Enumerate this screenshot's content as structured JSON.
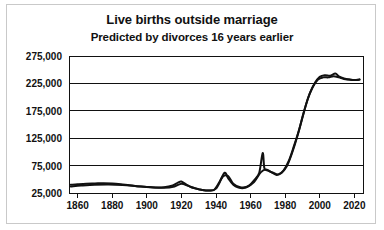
{
  "chart_data": {
    "type": "line",
    "title": "Live births outside marriage",
    "subtitle": "Predicted by divorces 16 years earlier",
    "xlabel": "",
    "ylabel": "",
    "grid": true,
    "legend": "none",
    "xlim": [
      1855,
      2025
    ],
    "ylim": [
      25000,
      275000
    ],
    "xticks": [
      1860,
      1880,
      1900,
      1920,
      1940,
      1960,
      1980,
      2000,
      2020
    ],
    "ytick_labels": [
      "275,000",
      "225,000",
      "175,000",
      "125,000",
      "75,000",
      "25,000"
    ],
    "yticks": [
      275000,
      225000,
      175000,
      125000,
      75000,
      25000
    ],
    "series": [
      {
        "name": "Live births outside marriage",
        "color": "#111111",
        "x": [
          1856,
          1860,
          1865,
          1870,
          1875,
          1880,
          1885,
          1890,
          1895,
          1900,
          1905,
          1910,
          1915,
          1918,
          1920,
          1923,
          1926,
          1930,
          1933,
          1936,
          1939,
          1942,
          1945,
          1947,
          1950,
          1953,
          1956,
          1959,
          1962,
          1965,
          1967,
          1968,
          1970,
          1973,
          1976,
          1979,
          1982,
          1985,
          1988,
          1991,
          1994,
          1997,
          2000,
          2003,
          2006,
          2009,
          2011,
          2014,
          2017,
          2020,
          2023
        ],
        "y": [
          40000,
          41000,
          42000,
          42500,
          43000,
          42500,
          41000,
          39000,
          37500,
          36000,
          35000,
          35500,
          39000,
          44000,
          46000,
          40000,
          35000,
          32000,
          30000,
          29500,
          31000,
          45000,
          62000,
          52000,
          40000,
          35000,
          34000,
          38000,
          48000,
          62000,
          98000,
          70000,
          66000,
          62000,
          59000,
          66000,
          83000,
          110000,
          140000,
          175000,
          205000,
          225000,
          237000,
          240000,
          239000,
          243000,
          238000,
          234000,
          232000,
          231000,
          232000
        ]
      },
      {
        "name": "Divorces 16 years earlier (prediction)",
        "color": "#111111",
        "x": [
          1856,
          1862,
          1870,
          1878,
          1886,
          1894,
          1902,
          1910,
          1916,
          1920,
          1924,
          1928,
          1932,
          1936,
          1940,
          1944,
          1947,
          1950,
          1954,
          1958,
          1962,
          1966,
          1969,
          1972,
          1975,
          1978,
          1981,
          1984,
          1987,
          1990,
          1993,
          1996,
          1999,
          2002,
          2005,
          2008,
          2011,
          2014,
          2017,
          2020,
          2023
        ],
        "y": [
          37000,
          38500,
          40000,
          40500,
          39500,
          37500,
          35500,
          34500,
          37000,
          42000,
          38000,
          33500,
          30500,
          29500,
          33000,
          55000,
          56000,
          42000,
          35500,
          36500,
          45000,
          63000,
          68000,
          63000,
          58000,
          62000,
          74000,
          98000,
          128000,
          163000,
          196000,
          219000,
          232000,
          236000,
          236000,
          238000,
          236000,
          233000,
          232000,
          231000,
          232000
        ]
      }
    ]
  },
  "axis": {
    "y_labels": [
      "275,000",
      "225,000",
      "175,000",
      "125,000",
      "75,000",
      "25,000"
    ],
    "x_labels": [
      "1860",
      "1880",
      "1900",
      "1920",
      "1940",
      "1960",
      "1980",
      "2000",
      "2020"
    ]
  },
  "colors": {
    "line": "#111111",
    "frame": "#111111",
    "grid": "#111111",
    "background": "#ffffff",
    "border": "#c9c9c9"
  }
}
